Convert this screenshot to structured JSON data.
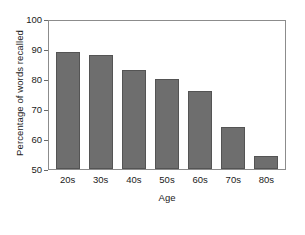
{
  "chart_data": {
    "type": "bar",
    "title": "",
    "xlabel": "Age",
    "ylabel": "Percentage of words recalled",
    "categories": [
      "20s",
      "30s",
      "40s",
      "50s",
      "60s",
      "70s",
      "80s"
    ],
    "values": [
      89,
      88,
      83,
      80,
      76,
      64,
      54.5
    ],
    "ylim": [
      50,
      100
    ],
    "yticks": [
      50,
      60,
      70,
      80,
      90,
      100
    ],
    "ytick_labels": [
      "50",
      "60",
      "70",
      "80",
      "90",
      "100"
    ],
    "grid": false,
    "legend": null,
    "legend_position": "none",
    "colors": {
      "bar_fill": "#6e6e6e",
      "bar_edge": "#545454",
      "axis": "#8c8c8c",
      "text": "#1a1a1a",
      "background": "#ffffff"
    }
  }
}
